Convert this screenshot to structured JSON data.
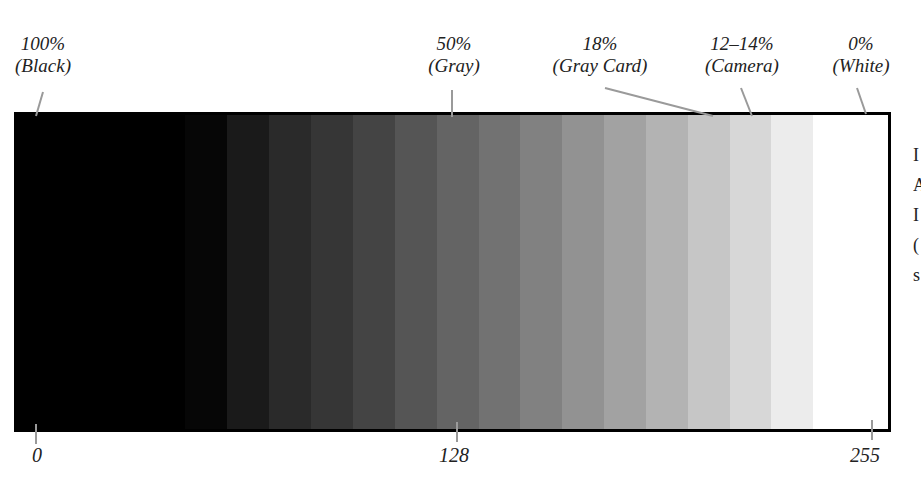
{
  "diagram": {
    "top_labels": [
      {
        "id": "black",
        "line1": "100%",
        "line2": "(Black)"
      },
      {
        "id": "gray",
        "line1": "50%",
        "line2": "(Gray)"
      },
      {
        "id": "graycard",
        "line1": "18%",
        "line2": "(Gray Card)"
      },
      {
        "id": "camera",
        "line1": "12–14%",
        "line2": "(Camera)"
      },
      {
        "id": "white",
        "line1": "0%",
        "line2": "(White)"
      }
    ],
    "bottom_labels": [
      {
        "id": "zero",
        "text": "0"
      },
      {
        "id": "mid",
        "text": "128"
      },
      {
        "id": "max",
        "text": "255"
      }
    ],
    "bands": [
      {
        "x": 0,
        "w": 168,
        "color": "#000000"
      },
      {
        "x": 168,
        "w": 42,
        "color": "#060606"
      },
      {
        "x": 210,
        "w": 42,
        "color": "#1a1a1a"
      },
      {
        "x": 252,
        "w": 42,
        "color": "#2a2a2a"
      },
      {
        "x": 294,
        "w": 42,
        "color": "#363636"
      },
      {
        "x": 336,
        "w": 42,
        "color": "#444444"
      },
      {
        "x": 378,
        "w": 42,
        "color": "#555555"
      },
      {
        "x": 420,
        "w": 42,
        "color": "#646464"
      },
      {
        "x": 462,
        "w": 41,
        "color": "#727272"
      },
      {
        "x": 503,
        "w": 42,
        "color": "#818181"
      },
      {
        "x": 545,
        "w": 42,
        "color": "#929292"
      },
      {
        "x": 587,
        "w": 42,
        "color": "#a2a2a2"
      },
      {
        "x": 629,
        "w": 42,
        "color": "#b3b3b3"
      },
      {
        "x": 671,
        "w": 42,
        "color": "#c6c6c6"
      },
      {
        "x": 713,
        "w": 41,
        "color": "#d7d7d7"
      },
      {
        "x": 754,
        "w": 42,
        "color": "#ececec"
      },
      {
        "x": 796,
        "w": 75,
        "color": "#ffffff"
      }
    ],
    "side_text_fragments": [
      "I",
      "A",
      "I",
      "(",
      "s",
      "I"
    ]
  }
}
